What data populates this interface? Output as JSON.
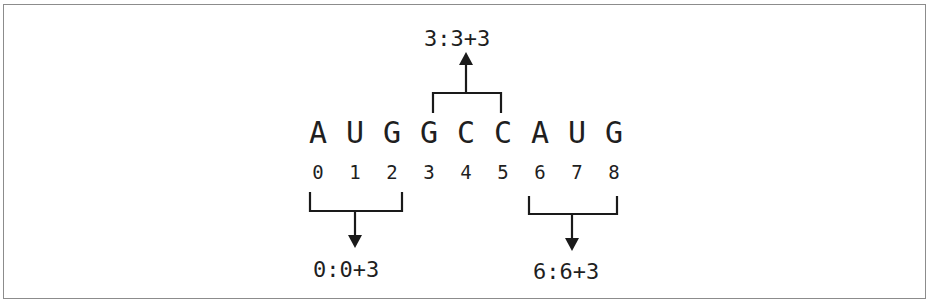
{
  "diagram": {
    "sequence": [
      "A",
      "U",
      "G",
      "G",
      "C",
      "C",
      "A",
      "U",
      "G"
    ],
    "indices": [
      "0",
      "1",
      "2",
      "3",
      "4",
      "5",
      "6",
      "7",
      "8"
    ],
    "codons": [
      {
        "label": "0:0+3",
        "start": 0,
        "end": 2,
        "direction": "down"
      },
      {
        "label": "3:3+3",
        "start": 3,
        "end": 5,
        "direction": "up"
      },
      {
        "label": "6:6+3",
        "start": 6,
        "end": 8,
        "direction": "down"
      }
    ]
  }
}
